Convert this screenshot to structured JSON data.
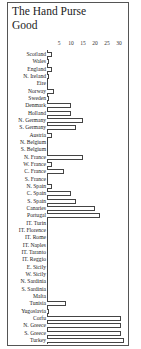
{
  "chart_data": {
    "type": "bar",
    "orientation": "horizontal",
    "title": "The Hand Purse",
    "subtitle": "Good",
    "xlabel": "",
    "ylabel": "",
    "xlim": [
      0,
      32
    ],
    "x_ticks": [
      5,
      10,
      15,
      20,
      25,
      30
    ],
    "grid": false,
    "legend": null,
    "categories": [
      "Scotland",
      "Wales",
      "England",
      "N. Ireland",
      "Eire",
      "Norway",
      "Sweden",
      "Denmark",
      "Holland",
      "N. Germany",
      "S. Germany",
      "Austria",
      "N. Belgium",
      "S. Belgium",
      "N. France",
      "W. France",
      "C. France",
      "S. France",
      "N. Spain",
      "C. Spain",
      "S. Spain",
      "Canaries",
      "Portugal",
      "IT. Turin",
      "IT. Florence",
      "IT. Rome",
      "IT. Naples",
      "IT. Taranto",
      "IT. Reggio",
      "E. Sicily",
      "W. Sicily",
      "N. Sardinia",
      "S. Sardinia",
      "Malta",
      "Tunisia",
      "Yugoslavia",
      "Corfu",
      "N. Greece",
      "S. Greece",
      "Turkey"
    ],
    "values": [
      2,
      1,
      2,
      0.5,
      0,
      3,
      1,
      10,
      10,
      15,
      12,
      2,
      0,
      0,
      15,
      2,
      7,
      0,
      2,
      10,
      12,
      20,
      22,
      0,
      0,
      0,
      0,
      0,
      0,
      0,
      0,
      0,
      0,
      0,
      8,
      1,
      31,
      31,
      31,
      32
    ]
  }
}
